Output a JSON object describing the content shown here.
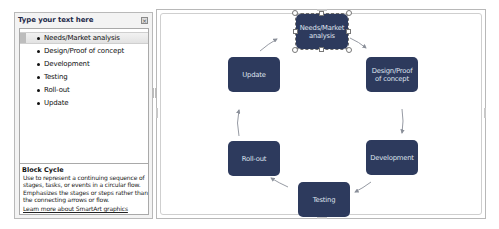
{
  "text_pane": {
    "title": "Type your text here",
    "close_icon": "close-icon",
    "items": [
      {
        "label": "Needs/Market analysis",
        "selected": true
      },
      {
        "label": "Design/Proof of concept",
        "selected": false
      },
      {
        "label": "Development",
        "selected": false
      },
      {
        "label": "Testing",
        "selected": false
      },
      {
        "label": "Roll-out",
        "selected": false
      },
      {
        "label": "Update",
        "selected": false
      }
    ],
    "description": {
      "title": "Block Cycle",
      "text": "Use to represent a continuing sequence of stages, tasks, or events in a circular flow. Emphasizes the stages or steps rather than the connecting arrows or flow.",
      "link": "Learn more about SmartArt graphics"
    }
  },
  "smartart": {
    "layout": "Block Cycle",
    "node_color": "#2d3a5d",
    "node_text_color": "#dfe3ee",
    "arrow_color": "#8a8f99",
    "nodes": [
      {
        "label": "Needs/Market analysis",
        "selected": true
      },
      {
        "label": "Design/Proof of concept"
      },
      {
        "label": "Development"
      },
      {
        "label": "Testing"
      },
      {
        "label": "Roll-out"
      },
      {
        "label": "Update"
      }
    ]
  }
}
